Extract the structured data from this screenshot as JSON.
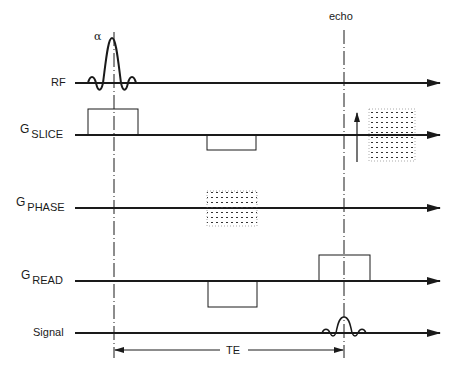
{
  "diagram": {
    "flip_angle_label": "α",
    "echo_label": "echo",
    "te_label": "TE",
    "rows": [
      {
        "id": "rf",
        "label": "RF",
        "prefix": "",
        "subscript": ""
      },
      {
        "id": "g_slice",
        "label": "G SLICE",
        "prefix": "G",
        "subscript": "SLICE"
      },
      {
        "id": "g_phase",
        "label": "G PHASE",
        "prefix": "G",
        "subscript": "PHASE"
      },
      {
        "id": "g_read",
        "label": "G READ",
        "prefix": "G",
        "subscript": "READ"
      },
      {
        "id": "signal",
        "label": "Signal",
        "prefix": "",
        "subscript": ""
      }
    ],
    "rf_label": "RF",
    "slice_prefix": "G",
    "slice_sub": "SLICE",
    "phase_prefix": "G",
    "phase_sub": "PHASE",
    "read_prefix": "G",
    "read_sub": "READ",
    "signal_label": "Signal",
    "colors": {
      "line": "#1a1a1a",
      "background": "#ffffff"
    }
  }
}
